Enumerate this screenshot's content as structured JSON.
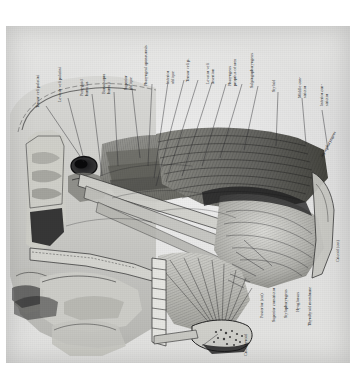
{
  "plate": {
    "kind": "anatomical-illustration",
    "subject": "Sagittal section of head and neck showing the pharyngeal and palatal musculature",
    "orientation": "labels rotated 90 degrees counter-clockwise",
    "medium": "halftone engraving, grayscale",
    "background_color": "#e3e3e1",
    "ink_color": "#15161a",
    "paper_color": "#ffffff"
  },
  "labels_top": [
    {
      "id": "tensor-veli-palatini",
      "text": "Tensor veli palatini"
    },
    {
      "id": "levator-veli-palatini",
      "text": "Levator veli palatini"
    },
    {
      "id": "pterygoid-hamulus",
      "text": "Pterygoid\nhamulus"
    },
    {
      "id": "bursa-sup-hamuli",
      "text": "Bursa supra\nhamuli"
    },
    {
      "id": "superior-oblique",
      "text": "Superior\noblique"
    },
    {
      "id": "pharyngeal-aponeurosis",
      "text": "Pharyngeal aponeurosis"
    },
    {
      "id": "inferior-oblique",
      "text": "Inferior\noblique"
    },
    {
      "id": "tensor-veli",
      "text": "Tensor veli p."
    },
    {
      "id": "levator-veli-insertion",
      "text": "Levator veli\ninsertion"
    },
    {
      "id": "pharyngeus-proprius",
      "text": "Pharyngeus\nproprius of area"
    },
    {
      "id": "salpingopharyngeus",
      "text": "Salpingopharyngeus"
    },
    {
      "id": "styloid-process",
      "text": "Styloid"
    },
    {
      "id": "middle-constrictor",
      "text": "Middle con-\nstrictor"
    },
    {
      "id": "inferior-constrictor",
      "text": "Inferior con-\nstrictor"
    }
  ],
  "labels_right": [
    {
      "id": "stylopharyngeus-right",
      "text": "Stylopharyngeus"
    },
    {
      "id": "cricoid-cartilage",
      "text": "Cricoid (cut)"
    }
  ],
  "labels_bottom": [
    {
      "id": "posterior-cut",
      "text": "Posterior (cut)"
    },
    {
      "id": "superior-constrictor",
      "text": "Superior constrictor"
    },
    {
      "id": "stylopharyngeus",
      "text": "Stylopharyngeus"
    },
    {
      "id": "hyoglossus",
      "text": "Hyoglossus"
    },
    {
      "id": "thyrohyoid-membrane",
      "text": "Thyrohyoid membrane"
    },
    {
      "id": "cricothyroid",
      "text": "Cricothyroid"
    },
    {
      "id": "genioglossus",
      "text": "Genioglossus"
    }
  ],
  "leader_lines": {
    "count": 21,
    "color": "#2a2b2f",
    "style": "hairline"
  }
}
